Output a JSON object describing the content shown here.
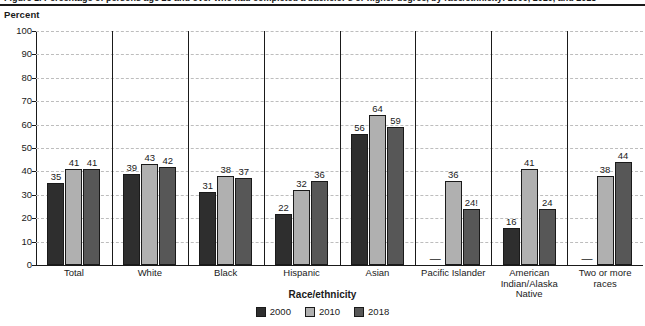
{
  "figure": {
    "caption_clipped": "Figure 1. Percentage of persons age 25 and over who had completed a bachelor's or higher degree, by race/ethnicity: 2000, 2010, and 2018"
  },
  "chart_data": {
    "type": "bar",
    "title": "",
    "xlabel": "Race/ethnicity",
    "ylabel": "Percent",
    "ylim": [
      0,
      100
    ],
    "ytick_step": 10,
    "yticks": [
      "0",
      "10",
      "20",
      "30",
      "40",
      "50",
      "60",
      "70",
      "80",
      "90",
      "100"
    ],
    "grid": true,
    "grid_style": "dashed-horizontal",
    "legend_position": "bottom-center",
    "categories": [
      "Total",
      "White",
      "Black",
      "Hispanic",
      "Asian",
      "Pacific Islander",
      "American\nIndian/Alaska\nNative",
      "Two or more\nraces"
    ],
    "category_lines": [
      [
        "Total"
      ],
      [
        "White"
      ],
      [
        "Black"
      ],
      [
        "Hispanic"
      ],
      [
        "Asian"
      ],
      [
        "Pacific Islander"
      ],
      [
        "American",
        "Indian/Alaska",
        "Native"
      ],
      [
        "Two or more",
        "races"
      ]
    ],
    "series": [
      {
        "name": "2000",
        "color": "#2e2e2e",
        "values": [
          35,
          39,
          31,
          22,
          56,
          null,
          16,
          null
        ],
        "labels": [
          "35",
          "39",
          "31",
          "22",
          "56",
          "—",
          "16",
          "—"
        ]
      },
      {
        "name": "2010",
        "color": "#b0b0b0",
        "values": [
          41,
          43,
          38,
          32,
          64,
          36,
          41,
          38
        ],
        "labels": [
          "41",
          "43",
          "38",
          "32",
          "64",
          "36",
          "41",
          "38"
        ]
      },
      {
        "name": "2018",
        "color": "#575757",
        "values": [
          41,
          42,
          37,
          36,
          59,
          24,
          24,
          44
        ],
        "labels": [
          "41",
          "42",
          "37",
          "36",
          "59",
          "24!",
          "24",
          "44"
        ]
      }
    ]
  }
}
